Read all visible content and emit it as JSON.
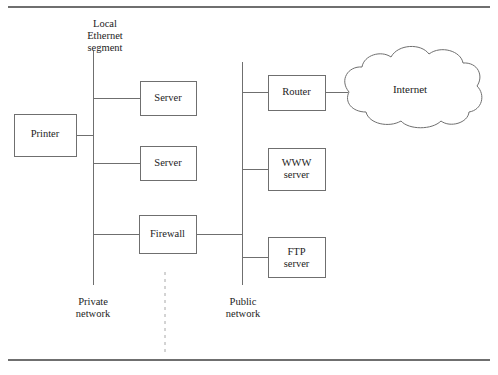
{
  "page": {
    "rules": {
      "top_visible": true,
      "bottom_visible": true
    }
  },
  "diagram": {
    "type": "network-topology",
    "colors": {
      "line": "#6f6f6f",
      "box_border": "#7a7a7a",
      "text": "#1c1c1c",
      "background": "#ffffff",
      "rule": "#6f6f6f"
    },
    "annotations": {
      "ethernet_segment": "Local\nEthernet\nsegment",
      "private_network": "Private\nnetwork",
      "public_network": "Public\nnetwork"
    },
    "nodes": [
      {
        "id": "printer",
        "label": "Printer",
        "x": 14,
        "y": 114,
        "w": 62,
        "h": 42
      },
      {
        "id": "server-1",
        "label": "Server",
        "x": 140,
        "y": 81,
        "w": 56,
        "h": 34
      },
      {
        "id": "server-2",
        "label": "Server",
        "x": 140,
        "y": 146,
        "w": 56,
        "h": 34
      },
      {
        "id": "firewall",
        "label": "Firewall",
        "x": 139,
        "y": 215,
        "w": 57,
        "h": 38
      },
      {
        "id": "router",
        "label": "Router",
        "x": 268,
        "y": 75,
        "w": 57,
        "h": 35
      },
      {
        "id": "www-server",
        "label": "WWW\nserver",
        "x": 268,
        "y": 148,
        "w": 57,
        "h": 42
      },
      {
        "id": "ftp-server",
        "label": "FTP\nserver",
        "x": 268,
        "y": 237,
        "w": 57,
        "h": 40
      }
    ],
    "cloud": {
      "id": "internet-cloud",
      "label": "Internet",
      "cx": 410,
      "cy": 90
    },
    "buses": [
      {
        "id": "private-bus",
        "x": 93,
        "y1": 51,
        "y2": 285
      },
      {
        "id": "public-bus",
        "x": 242,
        "y1": 62,
        "y2": 285
      }
    ],
    "divider": {
      "id": "network-divider",
      "x": 165,
      "y1": 272,
      "y2": 355,
      "style": "dashed"
    },
    "links": [
      {
        "from": "private-bus",
        "to": "server-1",
        "y": 98
      },
      {
        "from": "private-bus",
        "to": "printer",
        "y": 135
      },
      {
        "from": "private-bus",
        "to": "server-2",
        "y": 163
      },
      {
        "from": "private-bus",
        "to": "firewall",
        "y": 234
      },
      {
        "from": "firewall",
        "to": "public-bus",
        "y": 234
      },
      {
        "from": "public-bus",
        "to": "router",
        "y": 92
      },
      {
        "from": "router",
        "to": "internet",
        "y": 92
      },
      {
        "from": "public-bus",
        "to": "www-server",
        "y": 169
      },
      {
        "from": "public-bus",
        "to": "ftp-server",
        "y": 257
      }
    ]
  }
}
